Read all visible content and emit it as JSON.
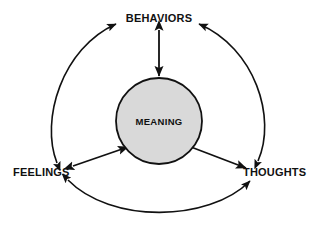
{
  "diagram": {
    "type": "cognitive-behavioral-cycle",
    "background_color": "#ffffff",
    "stroke_color": "#111111",
    "center": {
      "label": "MEANING",
      "shape": "circle",
      "fill_color": "#d9d9d9",
      "border_color": "#111111",
      "cx": 159,
      "cy": 121,
      "r": 43
    },
    "nodes": [
      {
        "id": "behaviors",
        "label": "BEHAVIORS",
        "x": 159,
        "y": 22,
        "anchor": "middle"
      },
      {
        "id": "feelings",
        "label": "FEELINGS",
        "x": 13,
        "y": 176,
        "anchor": "start"
      },
      {
        "id": "thoughts",
        "label": "THOUGHTS",
        "x": 243,
        "y": 176,
        "anchor": "start"
      }
    ],
    "connectors": [
      {
        "id": "behaviors-meaning",
        "kind": "straight",
        "arrowheads": "both",
        "from": "behaviors",
        "to": "meaning"
      },
      {
        "id": "feelings-meaning",
        "kind": "straight",
        "arrowheads": "both",
        "from": "feelings",
        "to": "meaning"
      },
      {
        "id": "thoughts-meaning",
        "kind": "straight",
        "arrowheads": "both",
        "from": "thoughts",
        "to": "meaning"
      },
      {
        "id": "feelings-behaviors-arc",
        "kind": "arc",
        "arrowheads": "both",
        "from": "feelings",
        "to": "behaviors"
      },
      {
        "id": "thoughts-behaviors-arc",
        "kind": "arc",
        "arrowheads": "both",
        "from": "thoughts",
        "to": "behaviors"
      },
      {
        "id": "feelings-thoughts-arc",
        "kind": "arc",
        "arrowheads": "both",
        "from": "feelings",
        "to": "thoughts"
      }
    ]
  }
}
